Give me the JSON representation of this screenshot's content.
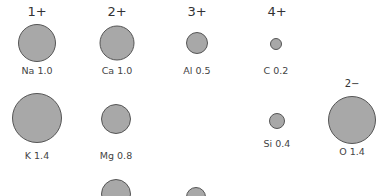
{
  "charges": [
    {
      "text": "1+",
      "x": 37,
      "y": 4
    },
    {
      "text": "2+",
      "x": 117,
      "y": 4
    },
    {
      "text": "3+",
      "x": 197,
      "y": 4
    },
    {
      "text": "4+",
      "x": 277,
      "y": 4
    },
    {
      "text": "2−",
      "x": 352,
      "y": 78
    }
  ],
  "ions": [
    {
      "label": "Na 1.0",
      "x": 37,
      "y": 43,
      "d": 38,
      "ly": 65
    },
    {
      "label": "Ca 1.0",
      "x": 117,
      "y": 43,
      "d": 35,
      "ly": 65
    },
    {
      "label": "Al 0.5",
      "x": 197,
      "y": 43,
      "d": 22,
      "ly": 65
    },
    {
      "label": "C 0.2",
      "x": 276,
      "y": 44,
      "d": 12,
      "ly": 65
    },
    {
      "label": "K 1.4",
      "x": 37,
      "y": 118,
      "d": 50,
      "ly": 150
    },
    {
      "label": "Mg 0.8",
      "x": 116,
      "y": 119,
      "d": 30,
      "ly": 150
    },
    {
      "label": "Si 0.4",
      "x": 277,
      "y": 121,
      "d": 16,
      "ly": 138
    },
    {
      "label": "O 1.4",
      "x": 352,
      "y": 120,
      "d": 48,
      "ly": 146
    },
    {
      "label": "",
      "x": 116,
      "y": 194,
      "d": 30,
      "ly": 220
    },
    {
      "label": "",
      "x": 196,
      "y": 197,
      "d": 20,
      "ly": 220
    }
  ],
  "colors": {
    "ion_fill": "#a8a8a8",
    "ion_stroke": "#555555",
    "text": "#444444"
  }
}
